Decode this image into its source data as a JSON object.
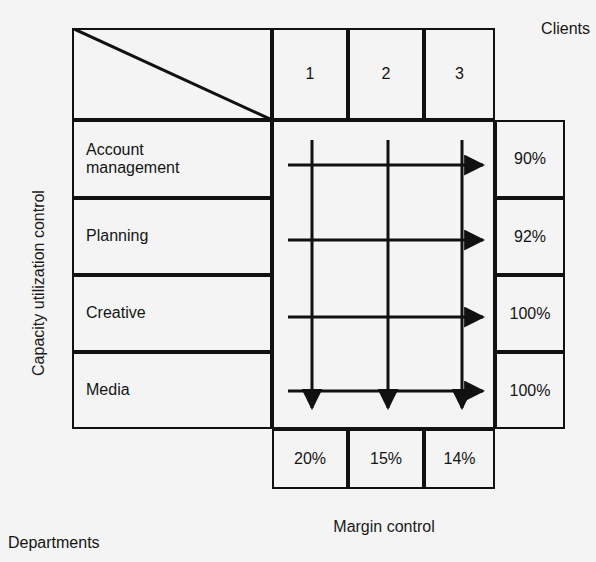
{
  "diagram": {
    "y_axis_label": "Capacity utilization control",
    "x_axis_label": "Margin control",
    "corner": {
      "columns_label": "Clients",
      "rows_label": "Departments"
    },
    "client_headers": [
      "1",
      "2",
      "3"
    ],
    "departments": [
      "Account\nmanagement",
      "Planning",
      "Creative",
      "Media"
    ],
    "department_labels": [
      "Account management",
      "Planning",
      "Creative",
      "Media"
    ],
    "capacity_values": [
      "90%",
      "92%",
      "100%",
      "100%"
    ],
    "margin_values": [
      "20%",
      "15%",
      "14%"
    ],
    "colors": {
      "ink": "#111111",
      "paper": "#f4f4f4",
      "text": "#141414"
    },
    "arrows": {
      "horizontal_direction": "right",
      "vertical_direction": "down",
      "horizontal_count": 4,
      "vertical_count": 3
    }
  }
}
